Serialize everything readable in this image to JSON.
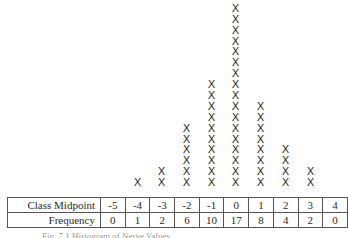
{
  "chart_data": {
    "type": "dot",
    "title": "",
    "marker": "X",
    "categories": [
      "-5",
      "-4",
      "-3",
      "-2",
      "-1",
      "0",
      "1",
      "2",
      "3",
      "4"
    ],
    "values": [
      0,
      1,
      2,
      6,
      10,
      17,
      8,
      4,
      2,
      0
    ],
    "xlabel": "Class Midpoint",
    "ylabel": "Frequency",
    "grid": false,
    "legend": null
  },
  "table": {
    "row1_label": "Class Midpoint",
    "row2_label": "Frequency",
    "midpoints": [
      "-5",
      "-4",
      "-3",
      "-2",
      "-1",
      "0",
      "1",
      "2",
      "3",
      "4"
    ],
    "frequencies": [
      "0",
      "1",
      "2",
      "6",
      "10",
      "17",
      "8",
      "4",
      "2",
      "0"
    ]
  },
  "caption": "Fig. 7.1 Histogram of Nerve Values"
}
